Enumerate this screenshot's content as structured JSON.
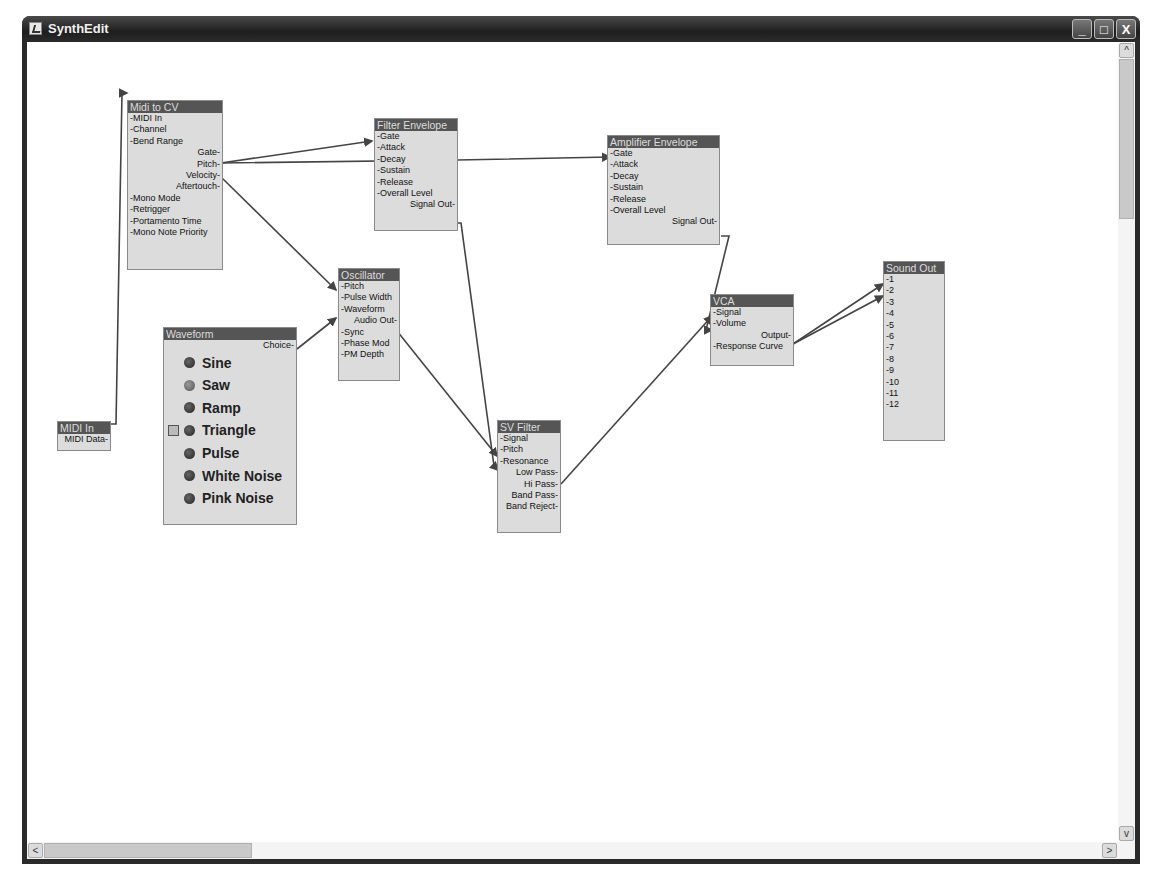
{
  "window": {
    "title": "SynthEdit",
    "buttons": {
      "minimize": "_",
      "maximize": "□",
      "close": "X"
    }
  },
  "scrollbars": {
    "up": "^",
    "down": "v",
    "left": "<",
    "right": ">"
  },
  "modules": {
    "midi_in": {
      "title": "MIDI In",
      "outputs": [
        "MIDI Data"
      ]
    },
    "midi_to_cv": {
      "title": "Midi to CV",
      "inputs_top": [
        "MIDI In",
        "Channel",
        "Bend Range"
      ],
      "outputs": [
        "Gate",
        "Pitch",
        "Velocity",
        "Aftertouch"
      ],
      "inputs_bottom": [
        "Mono Mode",
        "Retrigger",
        "Portamento Time",
        "Mono Note Priority"
      ]
    },
    "filter_envelope": {
      "title": "Filter Envelope",
      "inputs": [
        "Gate",
        "Attack",
        "Decay",
        "Sustain",
        "Release",
        "Overall Level"
      ],
      "outputs": [
        "Signal Out"
      ]
    },
    "amplifier_envelope": {
      "title": "Amplifier Envelope",
      "inputs": [
        "Gate",
        "Attack",
        "Decay",
        "Sustain",
        "Release",
        "Overall Level"
      ],
      "outputs": [
        "Signal Out"
      ]
    },
    "oscillator": {
      "title": "Oscillator",
      "inputs_top": [
        "Pitch",
        "Pulse Width",
        "Waveform"
      ],
      "outputs": [
        "Audio Out"
      ],
      "inputs_bottom": [
        "Sync",
        "Phase Mod",
        "PM Depth"
      ]
    },
    "waveform": {
      "title": "Waveform",
      "outputs": [
        "Choice"
      ],
      "options": [
        "Sine",
        "Saw",
        "Ramp",
        "Triangle",
        "Pulse",
        "White Noise",
        "Pink Noise"
      ],
      "selected": "Saw"
    },
    "sv_filter": {
      "title": "SV Filter",
      "inputs": [
        "Signal",
        "Pitch",
        "Resonance"
      ],
      "outputs": [
        "Low Pass",
        "Hi Pass",
        "Band Pass",
        "Band Reject"
      ]
    },
    "vca": {
      "title": "VCA",
      "inputs_top": [
        "Signal",
        "Volume"
      ],
      "outputs": [
        "Output"
      ],
      "inputs_bottom": [
        "Response Curve"
      ]
    },
    "sound_out": {
      "title": "Sound Out",
      "inputs": [
        "1",
        "2",
        "3",
        "4",
        "5",
        "6",
        "7",
        "8",
        "9",
        "10",
        "11",
        "12"
      ]
    }
  },
  "connections": [
    {
      "from": "MIDI In.MIDI Data",
      "to": "Midi to CV.MIDI In"
    },
    {
      "from": "Midi to CV.Gate",
      "to": "Filter Envelope.Gate"
    },
    {
      "from": "Midi to CV.Gate",
      "to": "Amplifier Envelope.Gate"
    },
    {
      "from": "Midi to CV.Pitch",
      "to": "Oscillator.Pitch"
    },
    {
      "from": "Waveform.Choice",
      "to": "Oscillator.Waveform"
    },
    {
      "from": "Oscillator.Audio Out",
      "to": "SV Filter.Signal"
    },
    {
      "from": "Filter Envelope.Signal Out",
      "to": "SV Filter.Pitch"
    },
    {
      "from": "SV Filter.Low Pass",
      "to": "VCA.Signal"
    },
    {
      "from": "Amplifier Envelope.Signal Out",
      "to": "VCA.Volume"
    },
    {
      "from": "VCA.Output",
      "to": "Sound Out.1"
    },
    {
      "from": "VCA.Output",
      "to": "Sound Out.2"
    }
  ]
}
